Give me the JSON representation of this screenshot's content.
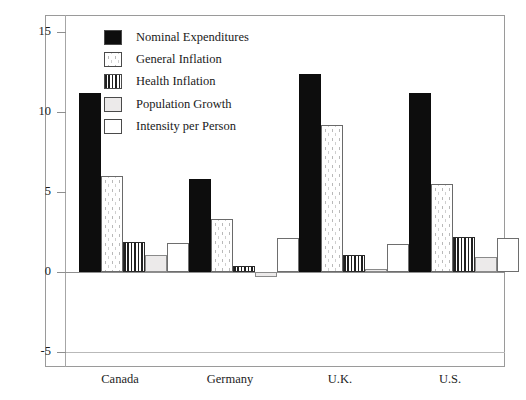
{
  "chart_data": {
    "type": "bar",
    "title": "",
    "subtitle": "",
    "xlabel": "",
    "ylabel": "",
    "categories": [
      "Canada",
      "Germany",
      "U.K.",
      "U.S."
    ],
    "series": [
      {
        "name": "Nominal Expenditures",
        "pattern": "solid-black",
        "values": [
          11.2,
          5.8,
          12.4,
          11.2
        ]
      },
      {
        "name": "General Inflation",
        "pattern": "dotted",
        "values": [
          6.0,
          3.3,
          9.2,
          5.5
        ]
      },
      {
        "name": "Health Inflation",
        "pattern": "vertical-stripes",
        "values": [
          1.9,
          0.4,
          1.05,
          2.2
        ]
      },
      {
        "name": "Population Growth",
        "pattern": "light-gray",
        "values": [
          1.05,
          -0.3,
          0.2,
          0.95
        ]
      },
      {
        "name": "Intensity per Person",
        "pattern": "empty-white",
        "values": [
          1.8,
          2.1,
          1.75,
          2.15
        ]
      }
    ],
    "ylim": [
      -5,
      16.5
    ],
    "yticks": [
      15,
      10,
      5,
      0,
      -5
    ],
    "ytick_labels": [
      "15",
      "10",
      "5",
      "0",
      "-5"
    ],
    "grid": false,
    "legend_position": "top-left-inside",
    "colors": {
      "nominal_expenditures": "#0d0d0d",
      "general_inflation": "#ffffff",
      "health_inflation": "#1f1f1f",
      "population_growth": "#eceaea",
      "intensity_per_person": "#ffffff",
      "axis": "#8f8f8f",
      "frame": "#9a9a9a",
      "text": "#1a1a1a"
    }
  },
  "legend": {
    "items": [
      {
        "label": "Nominal Expenditures"
      },
      {
        "label": "General Inflation"
      },
      {
        "label": "Health Inflation"
      },
      {
        "label": "Population Growth"
      },
      {
        "label": "Intensity per Person"
      }
    ]
  },
  "axes": {
    "y_tick_labels": [
      "15",
      "10",
      "5",
      "0",
      "-5"
    ],
    "x_tick_labels": [
      "Canada",
      "Germany",
      "U.K.",
      "U.S."
    ]
  }
}
